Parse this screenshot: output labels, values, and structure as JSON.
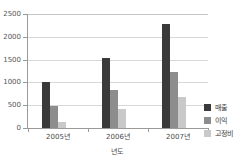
{
  "chart_data": {
    "type": "bar",
    "title": "",
    "xlabel": "년도",
    "ylabel": "",
    "categories": [
      "2005년",
      "2006년",
      "2007년"
    ],
    "series": [
      {
        "name": "매출",
        "color": "#3a3a3a",
        "values": [
          1000,
          1540,
          2280
        ]
      },
      {
        "name": "이익",
        "color": "#8d8d8d",
        "values": [
          490,
          840,
          1230
        ]
      },
      {
        "name": "고정비",
        "color": "#c9c9c9",
        "values": [
          140,
          420,
          680
        ]
      }
    ],
    "ylim": [
      0,
      2500
    ],
    "yticks": [
      0,
      500,
      1000,
      1500,
      2000,
      2500
    ],
    "ytick_labels": [
      "0",
      "500",
      "1000",
      "1500",
      "2000",
      "2500"
    ],
    "grid": true,
    "legend_position": "right"
  }
}
